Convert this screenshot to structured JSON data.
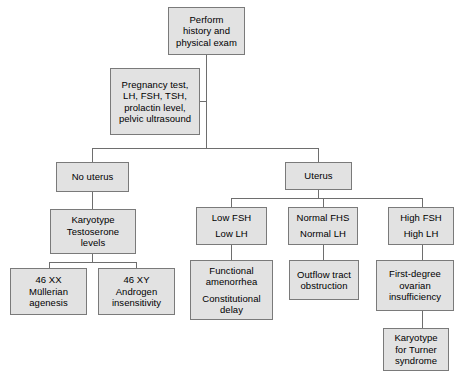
{
  "style": {
    "node_fill": "#e2e2e2",
    "node_border": "#7a7a7a",
    "edge_color": "#6e6e6e",
    "text_color": "#000000",
    "background": "#ffffff"
  },
  "nodes": {
    "perform_history": {
      "lines": [
        "Perform",
        "history and",
        "physical exam"
      ]
    },
    "labs": {
      "lines": [
        "Pregnancy test,",
        "LH, FSH, TSH,",
        "prolactin level,",
        "pelvic ultrasound"
      ]
    },
    "no_uterus": {
      "lines": [
        "No uterus"
      ]
    },
    "uterus": {
      "lines": [
        "Uterus"
      ]
    },
    "karyotype_testosterone": {
      "lines": [
        "Karyotype",
        "Testoserone",
        "levels"
      ]
    },
    "low_fsh": {
      "lines": [
        "Low FSH",
        "Low LH"
      ]
    },
    "normal_fsh": {
      "lines": [
        "Normal FHS",
        "Normal LH"
      ]
    },
    "high_fsh": {
      "lines": [
        "High FSH",
        "High LH"
      ]
    },
    "xx_mullerian": {
      "lines": [
        "46 XX",
        "Müllerian",
        "agenesis"
      ]
    },
    "xy_androgen": {
      "lines": [
        "46 XY",
        "Androgen",
        "insensitivity"
      ]
    },
    "functional_constitutional": {
      "lines": [
        "Functional",
        "amenorrhea",
        "Constitutional",
        "delay"
      ]
    },
    "outflow_tract": {
      "lines": [
        "Outflow tract",
        "obstruction"
      ]
    },
    "ovarian_insufficiency": {
      "lines": [
        "First-degree",
        "ovarian",
        "insufficiency"
      ]
    },
    "karyotype_turner": {
      "lines": [
        "Karyotype",
        "for Turner",
        "syndrome"
      ]
    }
  }
}
